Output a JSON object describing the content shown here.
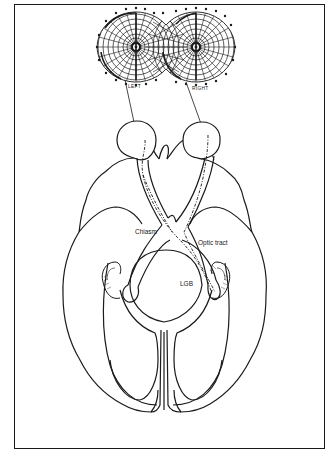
{
  "figure": {
    "visual_fields": {
      "left_label": "LEFT",
      "right_label": "RIGHT"
    },
    "labels": {
      "chiasm": "Chiasm",
      "optic_tract": "Optic tract",
      "lgb": "LGB"
    },
    "colors": {
      "ink": "#1a1a1a",
      "background": "#ffffff"
    }
  }
}
